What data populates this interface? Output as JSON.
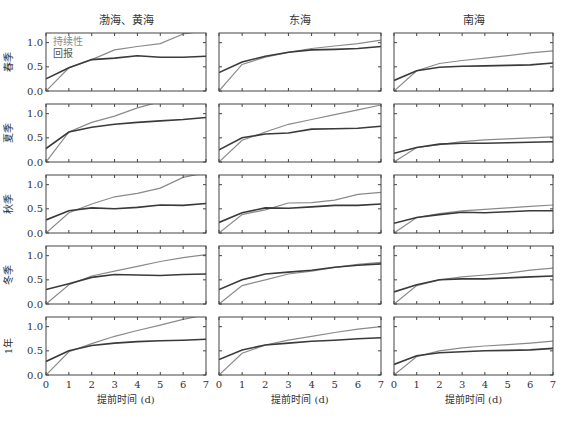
{
  "figure": {
    "columns": [
      "渤海、黄海",
      "东海",
      "南海"
    ],
    "rows": [
      "春季",
      "夏季",
      "秋季",
      "冬季",
      "1年"
    ],
    "xlabel": "提前时间 (d)",
    "legend": [
      "持续性",
      "回报"
    ],
    "colors": {
      "persistence": "#8a8a8a",
      "hindcast": "#3a3a3a",
      "axis": "#444444"
    }
  },
  "chart_data": {
    "type": "line",
    "title": "",
    "layout": "5 rows x 3 columns small multiples",
    "xlabel": "提前时间 (d)",
    "ylabel": "",
    "x": [
      0,
      1,
      2,
      3,
      4,
      5,
      6,
      7
    ],
    "x_ticks": [
      0,
      1,
      2,
      3,
      4,
      5,
      6,
      7
    ],
    "y_ticks": [
      0.0,
      0.5,
      1.0
    ],
    "ylim": [
      0,
      1.2
    ],
    "xlim": [
      0,
      7
    ],
    "grid": false,
    "legend": {
      "entries": [
        "持续性",
        "回报"
      ],
      "position": "upper left of first panel"
    },
    "panels": [
      {
        "row": "春季",
        "col": "渤海、黄海",
        "series": [
          {
            "name": "持续性",
            "values": [
              0.0,
              0.48,
              0.65,
              0.85,
              0.92,
              0.98,
              1.18,
              1.25
            ]
          },
          {
            "name": "回报",
            "values": [
              0.25,
              0.48,
              0.65,
              0.68,
              0.73,
              0.7,
              0.7,
              0.72
            ]
          }
        ]
      },
      {
        "row": "春季",
        "col": "东海",
        "series": [
          {
            "name": "持续性",
            "values": [
              0.0,
              0.55,
              0.7,
              0.8,
              0.88,
              0.93,
              0.98,
              1.05
            ]
          },
          {
            "name": "回报",
            "values": [
              0.38,
              0.6,
              0.72,
              0.8,
              0.85,
              0.86,
              0.88,
              0.92
            ]
          }
        ]
      },
      {
        "row": "春季",
        "col": "南海",
        "series": [
          {
            "name": "持续性",
            "values": [
              0.0,
              0.42,
              0.57,
              0.63,
              0.68,
              0.73,
              0.79,
              0.83
            ]
          },
          {
            "name": "回报",
            "values": [
              0.22,
              0.42,
              0.49,
              0.51,
              0.52,
              0.53,
              0.54,
              0.58
            ]
          }
        ]
      },
      {
        "row": "夏季",
        "col": "渤海、黄海",
        "series": [
          {
            "name": "持续性",
            "values": [
              0.0,
              0.62,
              0.82,
              0.95,
              1.12,
              1.25,
              1.35,
              1.45
            ]
          },
          {
            "name": "回报",
            "values": [
              0.28,
              0.62,
              0.72,
              0.78,
              0.82,
              0.85,
              0.88,
              0.92
            ]
          }
        ]
      },
      {
        "row": "夏季",
        "col": "东海",
        "series": [
          {
            "name": "持续性",
            "values": [
              0.0,
              0.45,
              0.62,
              0.78,
              0.88,
              0.98,
              1.08,
              1.18
            ]
          },
          {
            "name": "回报",
            "values": [
              0.25,
              0.5,
              0.58,
              0.6,
              0.68,
              0.69,
              0.7,
              0.74
            ]
          }
        ]
      },
      {
        "row": "夏季",
        "col": "南海",
        "series": [
          {
            "name": "持续性",
            "values": [
              0.0,
              0.3,
              0.36,
              0.42,
              0.46,
              0.48,
              0.5,
              0.52
            ]
          },
          {
            "name": "回报",
            "values": [
              0.18,
              0.3,
              0.37,
              0.39,
              0.39,
              0.4,
              0.41,
              0.42
            ]
          }
        ]
      },
      {
        "row": "秋季",
        "col": "渤海、黄海",
        "series": [
          {
            "name": "持续性",
            "values": [
              0.0,
              0.42,
              0.6,
              0.75,
              0.82,
              0.93,
              1.15,
              1.25
            ]
          },
          {
            "name": "回报",
            "values": [
              0.27,
              0.46,
              0.52,
              0.5,
              0.53,
              0.58,
              0.57,
              0.61
            ]
          }
        ]
      },
      {
        "row": "秋季",
        "col": "东海",
        "series": [
          {
            "name": "持续性",
            "values": [
              0.0,
              0.38,
              0.48,
              0.62,
              0.63,
              0.68,
              0.8,
              0.84
            ]
          },
          {
            "name": "回报",
            "values": [
              0.22,
              0.42,
              0.52,
              0.51,
              0.54,
              0.57,
              0.57,
              0.6
            ]
          }
        ]
      },
      {
        "row": "秋季",
        "col": "南海",
        "series": [
          {
            "name": "持续性",
            "values": [
              0.0,
              0.32,
              0.4,
              0.46,
              0.49,
              0.52,
              0.55,
              0.58
            ]
          },
          {
            "name": "回报",
            "values": [
              0.2,
              0.32,
              0.38,
              0.43,
              0.42,
              0.44,
              0.46,
              0.46
            ]
          }
        ]
      },
      {
        "row": "冬季",
        "col": "渤海、黄海",
        "series": [
          {
            "name": "持续性",
            "values": [
              0.0,
              0.4,
              0.58,
              0.68,
              0.78,
              0.88,
              0.96,
              1.02
            ]
          },
          {
            "name": "回报",
            "values": [
              0.3,
              0.42,
              0.55,
              0.61,
              0.6,
              0.59,
              0.61,
              0.62
            ]
          }
        ]
      },
      {
        "row": "冬季",
        "col": "东海",
        "series": [
          {
            "name": "持续性",
            "values": [
              0.0,
              0.38,
              0.5,
              0.62,
              0.68,
              0.76,
              0.82,
              0.86
            ]
          },
          {
            "name": "回报",
            "values": [
              0.3,
              0.5,
              0.62,
              0.66,
              0.7,
              0.76,
              0.8,
              0.83
            ]
          }
        ]
      },
      {
        "row": "冬季",
        "col": "南海",
        "series": [
          {
            "name": "持续性",
            "values": [
              0.0,
              0.38,
              0.5,
              0.56,
              0.6,
              0.64,
              0.7,
              0.74
            ]
          },
          {
            "name": "回报",
            "values": [
              0.25,
              0.4,
              0.5,
              0.52,
              0.52,
              0.54,
              0.56,
              0.58
            ]
          }
        ]
      },
      {
        "row": "1年",
        "col": "渤海、黄海",
        "series": [
          {
            "name": "持续性",
            "values": [
              0.0,
              0.48,
              0.65,
              0.8,
              0.92,
              1.03,
              1.15,
              1.25
            ]
          },
          {
            "name": "回报",
            "values": [
              0.28,
              0.5,
              0.61,
              0.66,
              0.69,
              0.71,
              0.72,
              0.74
            ]
          }
        ]
      },
      {
        "row": "1年",
        "col": "东海",
        "series": [
          {
            "name": "持续性",
            "values": [
              0.0,
              0.45,
              0.62,
              0.72,
              0.8,
              0.88,
              0.95,
              1.0
            ]
          },
          {
            "name": "回报",
            "values": [
              0.32,
              0.52,
              0.62,
              0.66,
              0.7,
              0.72,
              0.75,
              0.77
            ]
          }
        ]
      },
      {
        "row": "1年",
        "col": "南海",
        "series": [
          {
            "name": "持续性",
            "values": [
              0.0,
              0.38,
              0.5,
              0.56,
              0.6,
              0.63,
              0.66,
              0.7
            ]
          },
          {
            "name": "回报",
            "values": [
              0.22,
              0.4,
              0.46,
              0.48,
              0.5,
              0.51,
              0.52,
              0.55
            ]
          }
        ]
      }
    ]
  }
}
